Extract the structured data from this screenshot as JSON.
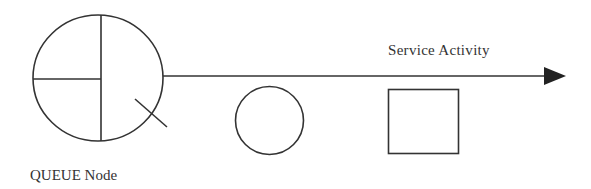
{
  "diagram": {
    "labels": {
      "service_activity": "Service Activity",
      "queue_node": "QUEUE Node"
    },
    "colors": {
      "stroke": "#333333",
      "background": "#ffffff"
    },
    "shapes": {
      "queue_node": {
        "type": "divided-circle",
        "cx": 98,
        "cy": 78,
        "rx": 65,
        "ry": 63
      },
      "arrow": {
        "type": "arrow",
        "x1": 163,
        "y1": 76,
        "x2": 565,
        "y2": 76
      },
      "circle": {
        "type": "circle",
        "cx": 269.5,
        "cy": 120.5,
        "r": 34
      },
      "square": {
        "type": "rect",
        "x": 388,
        "y": 89,
        "width": 70,
        "height": 64
      }
    }
  }
}
